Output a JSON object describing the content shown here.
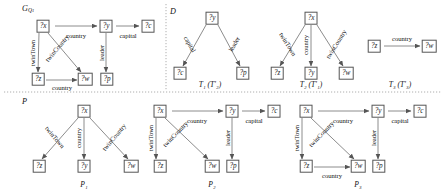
{
  "figure": {
    "width": 445,
    "height": 189,
    "background": "#ffffff",
    "edge_color": "#6e6e6e",
    "node_border_color": "#555555",
    "divider_color": "#9a9a9a"
  },
  "panels": [
    {
      "id": "GQ1",
      "label_main": "G",
      "label_sub": "Q",
      "label_sub2": "1",
      "label_display": "G",
      "caption": ""
    },
    {
      "id": "D",
      "label_display": "D",
      "caption": ""
    },
    {
      "id": "P",
      "label_display": "P",
      "caption": ""
    }
  ],
  "nodes": {
    "gq1": [
      {
        "name": "node-x",
        "text": "?x",
        "x": 43,
        "y": 26
      },
      {
        "name": "node-y",
        "text": "?y",
        "x": 106,
        "y": 26
      },
      {
        "name": "node-c",
        "text": "?c",
        "x": 148,
        "y": 26
      },
      {
        "name": "node-z",
        "text": "?z",
        "x": 38,
        "y": 79
      },
      {
        "name": "node-w",
        "text": "?w",
        "x": 85,
        "y": 79
      },
      {
        "name": "node-p",
        "text": "?p",
        "x": 107,
        "y": 79
      }
    ],
    "t1": [
      {
        "name": "node-y",
        "text": "?y",
        "x": 212,
        "y": 18
      },
      {
        "name": "node-c",
        "text": "?c",
        "x": 180,
        "y": 73
      },
      {
        "name": "node-p",
        "text": "?p",
        "x": 243,
        "y": 73
      }
    ],
    "t2": [
      {
        "name": "node-x",
        "text": "?x",
        "x": 311,
        "y": 18
      },
      {
        "name": "node-z",
        "text": "?z",
        "x": 277,
        "y": 73
      },
      {
        "name": "node-y",
        "text": "?y",
        "x": 311,
        "y": 73
      },
      {
        "name": "node-w",
        "text": "?w",
        "x": 346,
        "y": 73
      }
    ],
    "t3": [
      {
        "name": "node-z",
        "text": "?z",
        "x": 374,
        "y": 46
      },
      {
        "name": "node-w",
        "text": "?w",
        "x": 429,
        "y": 46
      }
    ],
    "p1": [
      {
        "name": "node-x",
        "text": "?x",
        "x": 84,
        "y": 111
      },
      {
        "name": "node-z",
        "text": "?z",
        "x": 39,
        "y": 166
      },
      {
        "name": "node-y",
        "text": "?y",
        "x": 84,
        "y": 166
      },
      {
        "name": "node-w",
        "text": "?w",
        "x": 131,
        "y": 166
      }
    ],
    "p2": [
      {
        "name": "node-x",
        "text": "?x",
        "x": 160,
        "y": 111
      },
      {
        "name": "node-y",
        "text": "?y",
        "x": 232,
        "y": 111
      },
      {
        "name": "node-c",
        "text": "?c",
        "x": 274,
        "y": 111
      },
      {
        "name": "node-z",
        "text": "?z",
        "x": 160,
        "y": 166
      },
      {
        "name": "node-w",
        "text": "?w",
        "x": 212,
        "y": 166
      },
      {
        "name": "node-p",
        "text": "?p",
        "x": 233,
        "y": 166
      }
    ],
    "p3": [
      {
        "name": "node-x",
        "text": "?x",
        "x": 306,
        "y": 111
      },
      {
        "name": "node-y",
        "text": "?y",
        "x": 378,
        "y": 111
      },
      {
        "name": "node-c",
        "text": "?c",
        "x": 420,
        "y": 111
      },
      {
        "name": "node-z",
        "text": "?z",
        "x": 306,
        "y": 166
      },
      {
        "name": "node-w",
        "text": "?w",
        "x": 358,
        "y": 166
      },
      {
        "name": "node-p",
        "text": "?p",
        "x": 379,
        "y": 166
      }
    ]
  },
  "edges": {
    "gq1": [
      {
        "name": "edge-country",
        "label": "country",
        "x1": 55,
        "y1": 26,
        "x2": 97,
        "y2": 26,
        "lx": 76,
        "ly": 35,
        "rot": 0
      },
      {
        "name": "edge-capital",
        "label": "capital",
        "x1": 116,
        "y1": 26,
        "x2": 139,
        "y2": 26,
        "lx": 128,
        "ly": 35,
        "rot": 0
      },
      {
        "name": "edge-twinTown",
        "label": "twinTown",
        "x1": 39,
        "y1": 33,
        "x2": 38,
        "y2": 72,
        "lx": 32,
        "ly": 53,
        "rot": -90
      },
      {
        "name": "edge-twinCountry",
        "label": "twinCountry",
        "x1": 48,
        "y1": 33,
        "x2": 81,
        "y2": 72,
        "lx": 57,
        "ly": 48,
        "rot": -50
      },
      {
        "name": "edge-leader",
        "label": "leader",
        "x1": 106,
        "y1": 33,
        "x2": 106,
        "y2": 72,
        "lx": 101,
        "ly": 53,
        "rot": -90
      },
      {
        "name": "edge-country2",
        "label": "country",
        "x1": 46,
        "y1": 80,
        "x2": 77,
        "y2": 80,
        "lx": 62,
        "ly": 87,
        "rot": 0
      }
    ],
    "t1": [
      {
        "name": "edge-capital",
        "label": "capital",
        "x1": 206,
        "y1": 25,
        "x2": 183,
        "y2": 66,
        "lx": 190,
        "ly": 44,
        "rot": 60
      },
      {
        "name": "edge-leader",
        "label": "leader",
        "x1": 218,
        "y1": 25,
        "x2": 240,
        "y2": 66,
        "lx": 234,
        "ly": 44,
        "rot": -60
      }
    ],
    "t2": [
      {
        "name": "edge-twinTown",
        "label": "twinTown",
        "x1": 305,
        "y1": 25,
        "x2": 280,
        "y2": 66,
        "lx": 288,
        "ly": 44,
        "rot": 58
      },
      {
        "name": "edge-country",
        "label": "country",
        "x1": 311,
        "y1": 25,
        "x2": 311,
        "y2": 66,
        "lx": 305,
        "ly": 45,
        "rot": -90
      },
      {
        "name": "edge-twinCountry",
        "label": "twinCountry",
        "x1": 317,
        "y1": 25,
        "x2": 343,
        "y2": 66,
        "lx": 336,
        "ly": 44,
        "rot": -58
      }
    ],
    "t3": [
      {
        "name": "edge-country",
        "label": "country",
        "x1": 384,
        "y1": 46,
        "x2": 420,
        "y2": 46,
        "lx": 402,
        "ly": 38,
        "rot": 0
      }
    ],
    "p1": [
      {
        "name": "edge-twinTown",
        "label": "twinTown",
        "x1": 78,
        "y1": 118,
        "x2": 42,
        "y2": 159,
        "lx": 55,
        "ly": 137,
        "rot": 50
      },
      {
        "name": "edge-country",
        "label": "country",
        "x1": 84,
        "y1": 118,
        "x2": 84,
        "y2": 159,
        "lx": 78,
        "ly": 138,
        "rot": -90
      },
      {
        "name": "edge-twinCountry",
        "label": "twinCountry",
        "x1": 90,
        "y1": 118,
        "x2": 128,
        "y2": 159,
        "lx": 114,
        "ly": 137,
        "rot": -50
      }
    ],
    "p2": [
      {
        "name": "edge-country",
        "label": "country",
        "x1": 172,
        "y1": 111,
        "x2": 223,
        "y2": 111,
        "lx": 197,
        "ly": 120,
        "rot": 0
      },
      {
        "name": "edge-capital",
        "label": "capital",
        "x1": 242,
        "y1": 111,
        "x2": 265,
        "y2": 111,
        "lx": 254,
        "ly": 120,
        "rot": 0
      },
      {
        "name": "edge-twinTown",
        "label": "twinTown",
        "x1": 156,
        "y1": 118,
        "x2": 156,
        "y2": 159,
        "lx": 150,
        "ly": 138,
        "rot": -90
      },
      {
        "name": "edge-twinCountry",
        "label": "twinCountry",
        "x1": 165,
        "y1": 118,
        "x2": 208,
        "y2": 159,
        "lx": 175,
        "ly": 134,
        "rot": -46
      },
      {
        "name": "edge-leader",
        "label": "leader",
        "x1": 232,
        "y1": 118,
        "x2": 232,
        "y2": 159,
        "lx": 227,
        "ly": 138,
        "rot": -90
      }
    ],
    "p3": [
      {
        "name": "edge-country",
        "label": "country",
        "x1": 318,
        "y1": 111,
        "x2": 369,
        "y2": 111,
        "lx": 343,
        "ly": 120,
        "rot": 0
      },
      {
        "name": "edge-capital",
        "label": "capital",
        "x1": 388,
        "y1": 111,
        "x2": 411,
        "y2": 111,
        "lx": 400,
        "ly": 120,
        "rot": 0
      },
      {
        "name": "edge-twinTown",
        "label": "twinTown",
        "x1": 302,
        "y1": 118,
        "x2": 302,
        "y2": 159,
        "lx": 296,
        "ly": 138,
        "rot": -90
      },
      {
        "name": "edge-twinCountry",
        "label": "twinCountry",
        "x1": 311,
        "y1": 118,
        "x2": 354,
        "y2": 159,
        "lx": 321,
        "ly": 134,
        "rot": -46
      },
      {
        "name": "edge-leader",
        "label": "leader",
        "x1": 378,
        "y1": 118,
        "x2": 378,
        "y2": 159,
        "lx": 373,
        "ly": 138,
        "rot": -90
      },
      {
        "name": "edge-country2",
        "label": "country",
        "x1": 314,
        "y1": 167,
        "x2": 350,
        "y2": 167,
        "lx": 332,
        "ly": 175,
        "rot": 0
      }
    ]
  },
  "captions": [
    {
      "name": "caption-t1",
      "main": "T",
      "sub": "1",
      "paren": "(T",
      "psub": "2",
      "tail": ")",
      "x": 210,
      "y": 80,
      "full": "T₁ (T′₂)"
    },
    {
      "name": "caption-t2",
      "main": "T",
      "sub": "2",
      "paren": "(T",
      "psub": "1",
      "tail": ")",
      "x": 311,
      "y": 80,
      "full": "T₂ (T′₁)"
    },
    {
      "name": "caption-t3",
      "main": "T",
      "sub": "3",
      "paren": "(T",
      "psub": "3",
      "tail": ")",
      "x": 400,
      "y": 80,
      "full": "T₃ (T′₃)"
    },
    {
      "name": "caption-p1",
      "main": "P",
      "sub": "1",
      "x": 84,
      "y": 180,
      "full": "P₁"
    },
    {
      "name": "caption-p2",
      "main": "P",
      "sub": "2",
      "x": 212,
      "y": 180,
      "full": "P₂"
    },
    {
      "name": "caption-p3",
      "main": "P",
      "sub": "3",
      "x": 358,
      "y": 180,
      "full": "P₃"
    }
  ],
  "panel_titles": [
    {
      "name": "panel-title-gq1",
      "x": 22,
      "y": 6,
      "text": "G",
      "sub": "Q₁"
    },
    {
      "name": "panel-title-d",
      "x": 170,
      "y": 8,
      "text": "D",
      "sub": ""
    },
    {
      "name": "panel-title-p",
      "x": 22,
      "y": 98,
      "text": "P",
      "sub": ""
    }
  ]
}
